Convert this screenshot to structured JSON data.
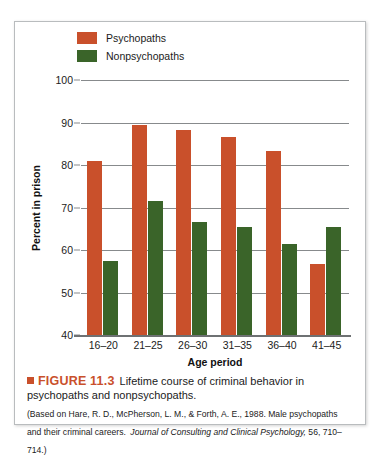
{
  "chart_data": {
    "type": "bar",
    "title": "Lifetime course of criminal behavior in psychopaths and nonpsychopaths.",
    "xlabel": "Age period",
    "ylabel": "Percent in prison",
    "categories": [
      "16–20",
      "21–25",
      "26–30",
      "31–35",
      "36–40",
      "41–45"
    ],
    "ylim": [
      40,
      100
    ],
    "yticks": [
      40,
      50,
      60,
      70,
      80,
      90,
      100
    ],
    "grid": true,
    "legend_position": "top-left",
    "series": [
      {
        "name": "Psychopaths",
        "color": "#C9502B",
        "values": [
          81,
          89.5,
          88.2,
          86.5,
          83.3,
          56.8
        ]
      },
      {
        "name": "Nonpsychopaths",
        "color": "#3A6429",
        "values": [
          57.5,
          71.5,
          66.7,
          65.3,
          61.5,
          65.3
        ]
      }
    ]
  },
  "legend": {
    "items": [
      {
        "label": "Psychopaths",
        "color": "#C9502B"
      },
      {
        "label": "Nonpsychopaths",
        "color": "#3A6429"
      }
    ]
  },
  "axes": {
    "y_title": "Percent in prison",
    "x_title": "Age period",
    "y_ticks": [
      "100",
      "90",
      "80",
      "70",
      "60",
      "50",
      "40"
    ],
    "x_ticks": [
      "16–20",
      "21–25",
      "26–30",
      "31–35",
      "36–40",
      "41–45"
    ]
  },
  "caption": {
    "figure_number": "FIGURE 11.3",
    "title": "Lifetime course of criminal behavior in psychopaths and nonpsychopaths.",
    "source_part1": "(Based on Hare, R. D., McPherson, L. M., & Forth, A. E., 1988. Male psychopaths and their criminal careers.",
    "source_journal": "Journal of Consulting and Clinical Psychology,",
    "source_part2": " 56, 710–714.)"
  }
}
